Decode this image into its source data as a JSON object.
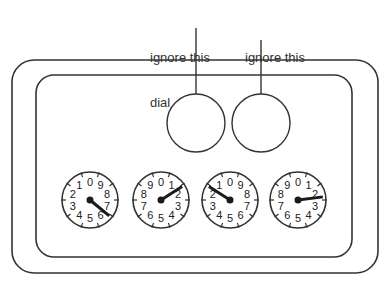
{
  "annotations": [
    {
      "line1": "ignore this",
      "line2": "dial",
      "x": 150,
      "y": 20,
      "leader_x": 196,
      "leader_top": 28
    },
    {
      "line1": "ignore this",
      "line2": "dial",
      "x": 245,
      "y": 20,
      "leader_x": 261,
      "leader_top": 40
    }
  ],
  "meter": {
    "outer_frame": {
      "x": 12,
      "y": 60,
      "w": 366,
      "h": 213,
      "r": 22
    },
    "inner_frame": {
      "x": 36,
      "y": 75,
      "w": 316,
      "h": 182,
      "r": 18
    },
    "ignored_dials": [
      {
        "cx": 196,
        "cy": 123,
        "r": 29
      },
      {
        "cx": 261,
        "cy": 123,
        "r": 29
      }
    ],
    "dials": [
      {
        "cx": 90,
        "cy": 200,
        "r": 28,
        "direction": "counterclockwise",
        "pointer_value": 6.4
      },
      {
        "cx": 161,
        "cy": 200,
        "r": 28,
        "direction": "clockwise",
        "pointer_value": 1.6
      },
      {
        "cx": 230,
        "cy": 200,
        "r": 28,
        "direction": "counterclockwise",
        "pointer_value": 1.6
      },
      {
        "cx": 298,
        "cy": 200,
        "r": 28,
        "direction": "clockwise",
        "pointer_value": 2.3
      }
    ],
    "digits": [
      "0",
      "1",
      "2",
      "3",
      "4",
      "5",
      "6",
      "7",
      "8",
      "9"
    ]
  },
  "colors": {
    "stroke": "#333333",
    "pointer": "#1a1a1a"
  }
}
